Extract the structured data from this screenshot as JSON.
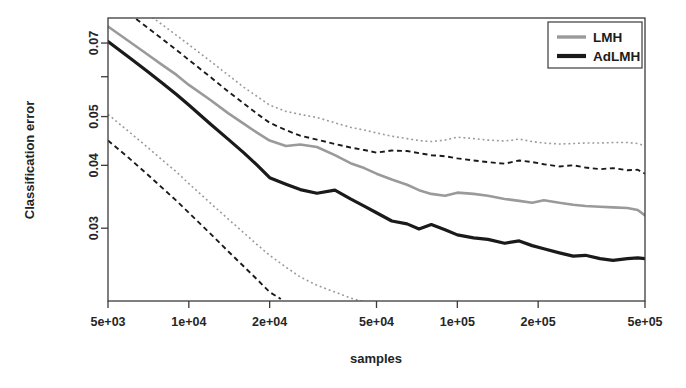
{
  "chart_data": {
    "type": "line",
    "title": "",
    "xlabel": "samples",
    "ylabel": "Classification error",
    "xscale": "log",
    "yscale": "log",
    "xlim": [
      5000,
      500000
    ],
    "ylim": [
      0.0215,
      0.0785
    ],
    "grid": false,
    "legend_position": "top-right",
    "xticks": [
      5000,
      10000,
      20000,
      50000,
      100000,
      200000,
      500000
    ],
    "xticklabels": [
      "5e+03",
      "1e+04",
      "2e+04",
      "5e+04",
      "1e+05",
      "2e+05",
      "5e+05"
    ],
    "yticks": [
      0.08,
      0.07,
      0.06,
      0.05,
      0.04,
      0.03
    ],
    "yticklabels": [
      "",
      "0.07",
      "",
      "0.05",
      "0.04",
      "0.03"
    ],
    "colors": {
      "lmh": "#9a9a9a",
      "adlmh": "#1a1a1a",
      "frame": "#3b3b3b",
      "background": "#ffffff"
    },
    "series": [
      {
        "name": "LMH",
        "style": "solid",
        "color": "#9a9a9a",
        "width": 2.6,
        "x": [
          5000,
          6000,
          7000,
          8000,
          9000,
          10000,
          12000,
          14000,
          16000,
          18000,
          20000,
          23000,
          26000,
          30000,
          35000,
          40000,
          45000,
          50000,
          57000,
          65000,
          72000,
          80000,
          90000,
          100000,
          115000,
          130000,
          150000,
          170000,
          190000,
          210000,
          240000,
          270000,
          300000,
          340000,
          380000,
          430000,
          470000,
          500000
        ],
        "y": [
          0.0755,
          0.0705,
          0.0665,
          0.0632,
          0.0605,
          0.0578,
          0.054,
          0.0508,
          0.0484,
          0.0464,
          0.0448,
          0.0437,
          0.044,
          0.0435,
          0.0419,
          0.0404,
          0.0395,
          0.0385,
          0.0375,
          0.0366,
          0.0357,
          0.0351,
          0.0348,
          0.0353,
          0.0351,
          0.0348,
          0.0343,
          0.034,
          0.0337,
          0.0341,
          0.0337,
          0.0334,
          0.0332,
          0.0331,
          0.033,
          0.0329,
          0.0326,
          0.0318
        ]
      },
      {
        "name": "AdLMH",
        "style": "solid",
        "color": "#1a1a1a",
        "width": 3.2,
        "x": [
          5000,
          6000,
          7000,
          8000,
          9000,
          10000,
          12000,
          14000,
          16000,
          18000,
          20000,
          23000,
          26000,
          30000,
          35000,
          40000,
          45000,
          50000,
          57000,
          65000,
          72000,
          80000,
          90000,
          100000,
          115000,
          130000,
          150000,
          170000,
          190000,
          210000,
          240000,
          270000,
          300000,
          340000,
          380000,
          430000,
          470000,
          500000
        ],
        "y": [
          0.0705,
          0.0655,
          0.0615,
          0.0582,
          0.0553,
          0.0527,
          0.0484,
          0.0451,
          0.0424,
          0.04,
          0.0378,
          0.0367,
          0.0358,
          0.0352,
          0.0357,
          0.0343,
          0.0332,
          0.0322,
          0.031,
          0.0306,
          0.0299,
          0.0305,
          0.0298,
          0.0291,
          0.0287,
          0.0285,
          0.028,
          0.0283,
          0.0277,
          0.0273,
          0.0268,
          0.0264,
          0.0265,
          0.0261,
          0.0259,
          0.0261,
          0.0262,
          0.0261
        ]
      },
      {
        "name": "LMH upper band",
        "style": "dotted",
        "color": "#9a9a9a",
        "width": 1.6,
        "x": [
          5000,
          6000,
          7000,
          8000,
          9000,
          10000,
          12000,
          14000,
          16000,
          18000,
          20000,
          23000,
          26000,
          30000,
          35000,
          40000,
          45000,
          50000,
          57000,
          65000,
          72000,
          80000,
          90000,
          100000,
          115000,
          130000,
          150000,
          170000,
          190000,
          210000,
          240000,
          270000,
          300000,
          340000,
          380000,
          430000,
          470000,
          500000
        ],
        "y": [
          0.09,
          0.0848,
          0.08,
          0.076,
          0.0725,
          0.0695,
          0.0645,
          0.0605,
          0.0572,
          0.0548,
          0.0527,
          0.0512,
          0.0505,
          0.0498,
          0.0486,
          0.0476,
          0.047,
          0.0464,
          0.0457,
          0.0452,
          0.0448,
          0.0446,
          0.0449,
          0.0455,
          0.0452,
          0.0449,
          0.0447,
          0.0451,
          0.0446,
          0.0443,
          0.0441,
          0.0442,
          0.0443,
          0.0443,
          0.0444,
          0.0444,
          0.0442,
          0.0437
        ]
      },
      {
        "name": "AdLMH upper band",
        "style": "dashed",
        "color": "#1a1a1a",
        "width": 1.9,
        "x": [
          5000,
          6000,
          7000,
          8000,
          9000,
          10000,
          12000,
          14000,
          16000,
          18000,
          20000,
          23000,
          26000,
          30000,
          35000,
          40000,
          45000,
          50000,
          57000,
          65000,
          72000,
          80000,
          90000,
          100000,
          115000,
          130000,
          150000,
          170000,
          190000,
          210000,
          240000,
          270000,
          300000,
          340000,
          380000,
          430000,
          470000,
          500000
        ],
        "y": [
          0.0855,
          0.08,
          0.0752,
          0.0712,
          0.0678,
          0.0648,
          0.06,
          0.0561,
          0.0531,
          0.0506,
          0.0486,
          0.047,
          0.0458,
          0.045,
          0.0441,
          0.0434,
          0.0429,
          0.0424,
          0.0428,
          0.0427,
          0.0423,
          0.0419,
          0.0417,
          0.0413,
          0.0409,
          0.0406,
          0.0403,
          0.0409,
          0.0406,
          0.0402,
          0.0398,
          0.04,
          0.0396,
          0.0393,
          0.0395,
          0.0391,
          0.0392,
          0.0385
        ]
      },
      {
        "name": "LMH lower band",
        "style": "dotted",
        "color": "#9a9a9a",
        "width": 1.6,
        "x": [
          5000,
          6000,
          7000,
          8000,
          9000,
          10000,
          12000,
          14000,
          16000,
          18000,
          20000,
          23000,
          26000,
          30000,
          35000,
          40000,
          45000,
          50000,
          57000,
          65000,
          72000,
          80000,
          90000,
          100000
        ],
        "y": [
          0.0505,
          0.0466,
          0.0435,
          0.0409,
          0.0388,
          0.0368,
          0.0337,
          0.0313,
          0.0294,
          0.0278,
          0.0265,
          0.0251,
          0.024,
          0.0231,
          0.0224,
          0.0218,
          0.0214,
          0.0211,
          0.0207,
          0.0204,
          0.0202,
          0.02,
          0.0198,
          0.0196
        ]
      },
      {
        "name": "AdLMH lower band",
        "style": "dashed",
        "color": "#1a1a1a",
        "width": 1.9,
        "x": [
          5000,
          6000,
          7000,
          8000,
          9000,
          10000,
          12000,
          14000,
          16000,
          18000,
          20000,
          22000
        ],
        "y": [
          0.0448,
          0.0413,
          0.0384,
          0.036,
          0.034,
          0.0322,
          0.0293,
          0.027,
          0.0252,
          0.0237,
          0.0224,
          0.0217
        ]
      }
    ]
  },
  "legend": {
    "entries": [
      {
        "label": "LMH",
        "color": "#9a9a9a"
      },
      {
        "label": "AdLMH",
        "color": "#1a1a1a"
      }
    ]
  },
  "axes": {
    "x_label": "samples",
    "y_label": "Classification error",
    "x_tick_labels": [
      "5e+03",
      "1e+04",
      "2e+04",
      "5e+04",
      "1e+05",
      "2e+05",
      "5e+05"
    ],
    "y_tick_labels": [
      "0.07",
      "0.05",
      "0.04",
      "0.03"
    ]
  }
}
